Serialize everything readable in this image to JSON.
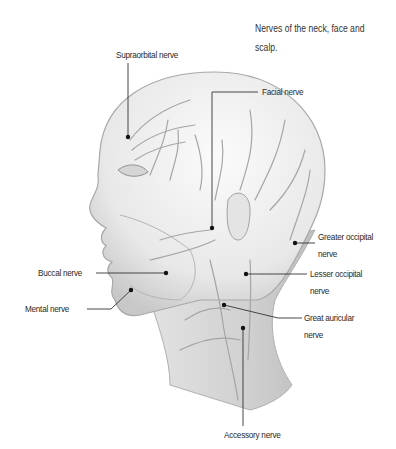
{
  "title": {
    "line1": "Nerves of the neck, face and",
    "line2": "scalp."
  },
  "labels": {
    "supraorbital": "Supraorbital nerve",
    "facial": "Facial nerve",
    "greater_occipital_1": "Greater occipital",
    "greater_occipital_2": "nerve",
    "lesser_occipital_1": "Lesser occipital",
    "lesser_occipital_2": "nerve",
    "great_auricular_1": "Great auricular",
    "great_auricular_2": "nerve",
    "buccal": "Buccal nerve",
    "mental": "Mental nerve",
    "accessory": "Accessory nerve"
  },
  "colors": {
    "leader_line": "#333333",
    "illustration_stroke": "#9a9a9a",
    "skin_shade": "#e6e6e6"
  }
}
